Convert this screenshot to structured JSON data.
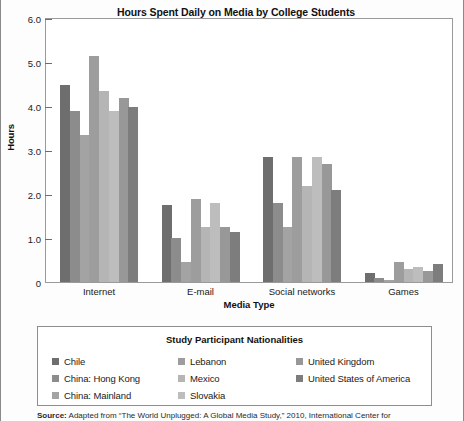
{
  "chart_data": {
    "type": "bar",
    "title": "Hours Spent Daily on Media by College Students",
    "xlabel": "Media Type",
    "ylabel": "Hours",
    "ylim": [
      0,
      6.0
    ],
    "ytick_labels": [
      "6.0",
      "5.0",
      "4.0",
      "3.0",
      "2.0",
      "1.0",
      "0"
    ],
    "ytick_values": [
      6.0,
      5.0,
      4.0,
      3.0,
      2.0,
      1.0,
      0
    ],
    "grid": false,
    "legend_position": "below",
    "legend_title": "Study Participant Nationalities",
    "categories": [
      "Internet",
      "E-mail",
      "Social networks",
      "Games"
    ],
    "series": [
      {
        "name": "Chile",
        "color": "#6e6e6e",
        "values": [
          4.5,
          1.75,
          2.85,
          0.2
        ]
      },
      {
        "name": "China: Hong Kong",
        "color": "#8c8c8c",
        "values": [
          3.9,
          1.0,
          1.8,
          0.1
        ]
      },
      {
        "name": "China: Mainland",
        "color": "#a3a3a3",
        "values": [
          3.35,
          0.45,
          1.25,
          0.05
        ]
      },
      {
        "name": "Lebanon",
        "color": "#9d9d9d",
        "values": [
          5.15,
          1.9,
          2.85,
          0.45
        ]
      },
      {
        "name": "Mexico",
        "color": "#b5b5b5",
        "values": [
          4.35,
          1.25,
          2.2,
          0.3
        ]
      },
      {
        "name": "Slovakia",
        "color": "#bdbdbd",
        "values": [
          3.9,
          1.8,
          2.85,
          0.35
        ]
      },
      {
        "name": "United Kingdom",
        "color": "#989898",
        "values": [
          4.2,
          1.25,
          2.7,
          0.25
        ]
      },
      {
        "name": "United States of America",
        "color": "#7d7d7d",
        "values": [
          4.0,
          1.15,
          2.1,
          0.4
        ]
      }
    ]
  },
  "legend": {
    "title": "Study Participant Nationalities",
    "columns": [
      [
        {
          "label": "Chile",
          "color": "#6e6e6e"
        },
        {
          "label": "China: Hong Kong",
          "color": "#8c8c8c"
        },
        {
          "label": "China: Mainland",
          "color": "#a3a3a3"
        }
      ],
      [
        {
          "label": "Lebanon",
          "color": "#9d9d9d"
        },
        {
          "label": "Mexico",
          "color": "#b5b5b5"
        },
        {
          "label": "Slovakia",
          "color": "#bdbdbd"
        }
      ],
      [
        {
          "label": "United Kingdom",
          "color": "#989898"
        },
        {
          "label": "United States of America",
          "color": "#7d7d7d"
        }
      ]
    ]
  },
  "source": {
    "label": "Source:",
    "text": " Adapted from “The World Unplugged: A Global Media Study,” 2010, International Center for"
  }
}
